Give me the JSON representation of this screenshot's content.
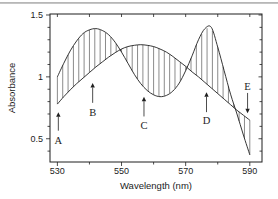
{
  "figure": {
    "background": "#ffffff",
    "top_border_color": "#b7b7b7",
    "line_color": "#1f1f1f",
    "hatch_color": "#2b2b2b",
    "text_color": "#1c1c1c"
  },
  "chart_data": {
    "type": "line",
    "title": "",
    "xlabel": "Wavelength (nm)",
    "ylabel": "Absorbance",
    "xlim": [
      527.7,
      593.8
    ],
    "ylim": [
      0.312,
      1.508
    ],
    "grid": false,
    "legend": "none",
    "frame": "full-box",
    "x_major_ticks": [
      530,
      550,
      570,
      590
    ],
    "x_major_tick_labels": [
      "530",
      "550",
      "570",
      "590"
    ],
    "x_minor_ticks": [
      540,
      560,
      580
    ],
    "y_major_ticks": [
      {
        "v": 0.5,
        "label": "0.5"
      },
      {
        "v": 1.0,
        "label": "1"
      },
      {
        "v": 1.5,
        "label": "1.5"
      }
    ],
    "y_minor_ticks": [
      0.4,
      0.6,
      0.7,
      0.8,
      0.9,
      1.1,
      1.2,
      1.3,
      1.4
    ],
    "series": [
      {
        "name": "two-peak-spectrum",
        "x_start": 530,
        "x_step": 2,
        "y": [
          1.0,
          1.11,
          1.21,
          1.29,
          1.35,
          1.38,
          1.39,
          1.375,
          1.34,
          1.28,
          1.2,
          1.11,
          1.02,
          0.945,
          0.89,
          0.855,
          0.84,
          0.85,
          0.885,
          0.95,
          1.05,
          1.17,
          1.3,
          1.39,
          1.4,
          1.24,
          1.05,
          0.86,
          0.7,
          0.53,
          0.37
        ]
      },
      {
        "name": "single-peak-spectrum",
        "x_start": 530,
        "x_step": 2,
        "y": [
          0.78,
          0.84,
          0.895,
          0.945,
          0.99,
          1.035,
          1.08,
          1.12,
          1.16,
          1.195,
          1.225,
          1.245,
          1.255,
          1.26,
          1.255,
          1.245,
          1.225,
          1.2,
          1.165,
          1.125,
          1.085,
          1.04,
          1.0,
          0.955,
          0.91,
          0.865,
          0.82,
          0.775,
          0.73,
          0.69,
          0.65
        ]
      }
    ],
    "hatch": {
      "style": "vertical-lines-between-curves",
      "between_series": [
        0,
        1
      ],
      "start": 530,
      "end": 590,
      "count": 36
    },
    "annotations": [
      {
        "label": "A",
        "x": 530.3,
        "tip_y": 0.715,
        "tail_y": 0.565,
        "label_y": 0.485,
        "dir": "up"
      },
      {
        "label": "B",
        "x": 541.0,
        "tip_y": 0.95,
        "tail_y": 0.79,
        "label_y": 0.715,
        "dir": "up"
      },
      {
        "label": "C",
        "x": 557.0,
        "tip_y": 0.84,
        "tail_y": 0.68,
        "label_y": 0.605,
        "dir": "up"
      },
      {
        "label": "D",
        "x": 576.5,
        "tip_y": 0.875,
        "tail_y": 0.715,
        "label_y": 0.645,
        "dir": "up"
      },
      {
        "label": "E",
        "x": 589.3,
        "tip_y": 0.705,
        "tail_y": 0.87,
        "label_y": 0.925,
        "dir": "down"
      }
    ]
  }
}
